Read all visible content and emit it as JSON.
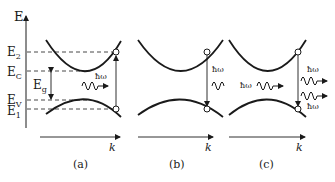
{
  "figure": {
    "axis_label_energy": "E",
    "axis_label_k": "k",
    "levels": {
      "E2": {
        "main": "E",
        "sub": "2"
      },
      "EC": {
        "main": "E",
        "sub": "C"
      },
      "Eg": {
        "main": "E",
        "sub": "g"
      },
      "EV": {
        "main": "E",
        "sub": "V"
      },
      "E1": {
        "main": "E",
        "sub": "1"
      }
    },
    "photon_label": "ħω",
    "panels": [
      {
        "id": "a",
        "caption": "(a)",
        "process": "absorption"
      },
      {
        "id": "b",
        "caption": "(b)",
        "process": "spontaneous emission"
      },
      {
        "id": "c",
        "caption": "(c)",
        "process": "stimulated emission"
      }
    ]
  }
}
